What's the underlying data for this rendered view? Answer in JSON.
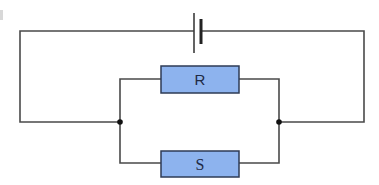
{
  "diagram": {
    "type": "circuit",
    "title": "",
    "colors": {
      "wire": "#4a4a4a",
      "resistor_fill": "#8db3ee",
      "resistor_border": "#2e3b55",
      "junction": "#111111",
      "label": "#1f2a44"
    },
    "components": [
      {
        "id": "battery",
        "kind": "cell",
        "label": ""
      },
      {
        "id": "R",
        "kind": "resistor",
        "label": "R"
      },
      {
        "id": "S",
        "kind": "resistor",
        "label": "S"
      }
    ],
    "junctions": 2,
    "topology": "Cell in series with R and S connected in parallel"
  }
}
